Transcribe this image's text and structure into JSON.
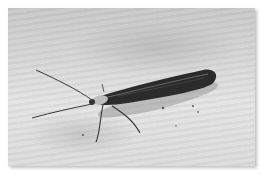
{
  "image": {
    "subject": "moth resting on wooden surface",
    "style": "grayscale photograph",
    "colors": {
      "background_wood": "#d6d6d6",
      "moth_body": "#2a2a2a",
      "moth_highlight": "#9a9a9a",
      "shadow": "#7a7a7a"
    }
  }
}
